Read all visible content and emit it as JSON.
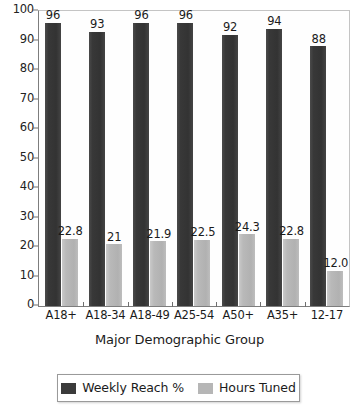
{
  "chart_data": {
    "type": "bar",
    "title": "",
    "xlabel": "Major Demographic Group",
    "ylabel": "",
    "ylim": [
      0,
      100
    ],
    "yticks": [
      0,
      10,
      20,
      30,
      40,
      50,
      60,
      70,
      80,
      90,
      100
    ],
    "grid": false,
    "legend_position": "bottom",
    "categories": [
      "A18+",
      "A18-34",
      "A18-49",
      "A25-54",
      "A50+",
      "A35+",
      "12-17"
    ],
    "series": [
      {
        "name": "Weekly Reach %",
        "color": "#3b3b3b",
        "values": [
          96,
          93,
          96,
          96,
          92,
          94,
          88
        ],
        "labels": [
          "96",
          "93",
          "96",
          "96",
          "92",
          "94",
          "88"
        ]
      },
      {
        "name": "Hours Tuned",
        "color": "#b6b6b6",
        "values": [
          22.8,
          21,
          21.9,
          22.5,
          24.3,
          22.8,
          12.0
        ],
        "labels": [
          "22.8",
          "21",
          "21.9",
          "22.5",
          "24.3",
          "22.8",
          "12.0"
        ]
      }
    ]
  },
  "axis": {
    "x_title": "Major Demographic Group"
  }
}
